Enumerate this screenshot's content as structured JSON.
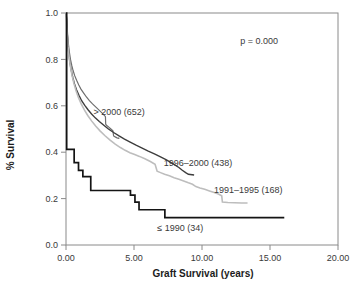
{
  "figure": {
    "background": "#ffffff",
    "frame_color": "#8a8a8a"
  },
  "annotations": {
    "p_value": "p = 0.000"
  },
  "chart_data": {
    "type": "line",
    "title": "",
    "subtitle": "",
    "xlabel": "Graft Survival (years)",
    "ylabel": "% Survival",
    "xlim": [
      0,
      20
    ],
    "ylim": [
      0,
      1.0
    ],
    "xticks": [
      0,
      5,
      10,
      15,
      20
    ],
    "xtick_labels": [
      "0.00",
      "5.00",
      "10.00",
      "15.00",
      "20.00"
    ],
    "yticks": [
      0.0,
      0.2,
      0.4,
      0.6,
      0.8,
      1.0
    ],
    "ytick_labels": [
      "0.0",
      "0.2",
      "0.4",
      "0.6",
      "0.8",
      "1.0"
    ],
    "grid": false,
    "legend_position": "inline-annotations",
    "annotations": [
      {
        "text": "p = 0.000",
        "x": 14.2,
        "y": 0.865
      }
    ],
    "series": [
      {
        "name": "> 2000 (652)",
        "label": "> 2000 (652)",
        "n": 652,
        "color": "#6e6e6e",
        "linewidth": 1.2,
        "label_x": 3.9,
        "label_y": 0.575,
        "points": [
          [
            0.0,
            1.0
          ],
          [
            0.04,
            0.985
          ],
          [
            0.08,
            0.945
          ],
          [
            0.12,
            0.905
          ],
          [
            0.18,
            0.865
          ],
          [
            0.25,
            0.83
          ],
          [
            0.33,
            0.8
          ],
          [
            0.42,
            0.775
          ],
          [
            0.52,
            0.752
          ],
          [
            0.64,
            0.73
          ],
          [
            0.78,
            0.71
          ],
          [
            0.94,
            0.69
          ],
          [
            1.1,
            0.672
          ],
          [
            1.3,
            0.655
          ],
          [
            1.5,
            0.638
          ],
          [
            1.72,
            0.622
          ],
          [
            1.95,
            0.608
          ],
          [
            2.2,
            0.594
          ],
          [
            2.45,
            0.58
          ],
          [
            2.7,
            0.566
          ],
          [
            2.9,
            0.553
          ],
          [
            2.92,
            0.52
          ],
          [
            3.0,
            0.515
          ],
          [
            3.15,
            0.508
          ],
          [
            3.3,
            0.5
          ],
          [
            3.45,
            0.492
          ],
          [
            3.5,
            0.47
          ],
          [
            3.62,
            0.466
          ],
          [
            3.75,
            0.462
          ],
          [
            3.88,
            0.46
          ],
          [
            3.92,
            0.462
          ]
        ]
      },
      {
        "name": "1996–2000 (438)",
        "label": "1996–2000 (438)",
        "n": 438,
        "color": "#3d3d3d",
        "linewidth": 1.4,
        "label_x": 9.7,
        "label_y": 0.352,
        "points": [
          [
            0.0,
            1.0
          ],
          [
            0.04,
            0.975
          ],
          [
            0.08,
            0.925
          ],
          [
            0.13,
            0.875
          ],
          [
            0.2,
            0.83
          ],
          [
            0.28,
            0.79
          ],
          [
            0.38,
            0.755
          ],
          [
            0.5,
            0.722
          ],
          [
            0.62,
            0.695
          ],
          [
            0.78,
            0.668
          ],
          [
            0.95,
            0.645
          ],
          [
            1.15,
            0.622
          ],
          [
            1.38,
            0.602
          ],
          [
            1.62,
            0.583
          ],
          [
            1.88,
            0.565
          ],
          [
            2.15,
            0.548
          ],
          [
            2.45,
            0.532
          ],
          [
            2.78,
            0.516
          ],
          [
            3.12,
            0.5
          ],
          [
            3.5,
            0.485
          ],
          [
            3.9,
            0.47
          ],
          [
            4.3,
            0.456
          ],
          [
            4.72,
            0.443
          ],
          [
            5.15,
            0.43
          ],
          [
            5.6,
            0.418
          ],
          [
            6.05,
            0.405
          ],
          [
            6.5,
            0.393
          ],
          [
            6.95,
            0.38
          ],
          [
            7.35,
            0.368
          ],
          [
            7.7,
            0.356
          ],
          [
            8.0,
            0.345
          ],
          [
            8.3,
            0.334
          ],
          [
            8.55,
            0.322
          ],
          [
            8.8,
            0.312
          ],
          [
            9.0,
            0.305
          ],
          [
            9.42,
            0.302
          ]
        ]
      },
      {
        "name": "1991–1995 (168)",
        "label": "1991–1995 (168)",
        "n": 168,
        "color": "#bdbdbd",
        "linewidth": 1.6,
        "label_x": 13.4,
        "label_y": 0.238,
        "points": [
          [
            0.0,
            1.0
          ],
          [
            0.04,
            0.96
          ],
          [
            0.09,
            0.905
          ],
          [
            0.15,
            0.855
          ],
          [
            0.23,
            0.81
          ],
          [
            0.33,
            0.768
          ],
          [
            0.45,
            0.73
          ],
          [
            0.58,
            0.697
          ],
          [
            0.74,
            0.665
          ],
          [
            0.92,
            0.635
          ],
          [
            1.12,
            0.608
          ],
          [
            1.35,
            0.582
          ],
          [
            1.6,
            0.558
          ],
          [
            1.88,
            0.535
          ],
          [
            2.18,
            0.513
          ],
          [
            2.5,
            0.492
          ],
          [
            2.85,
            0.472
          ],
          [
            3.22,
            0.453
          ],
          [
            3.62,
            0.435
          ],
          [
            4.0,
            0.42
          ],
          [
            4.35,
            0.408
          ],
          [
            4.7,
            0.398
          ],
          [
            5.05,
            0.39
          ],
          [
            5.4,
            0.382
          ],
          [
            5.8,
            0.372
          ],
          [
            6.2,
            0.36
          ],
          [
            6.55,
            0.348
          ],
          [
            6.7,
            0.318
          ],
          [
            6.95,
            0.312
          ],
          [
            7.25,
            0.305
          ],
          [
            7.6,
            0.298
          ],
          [
            7.95,
            0.29
          ],
          [
            8.3,
            0.283
          ],
          [
            8.65,
            0.276
          ],
          [
            9.0,
            0.268
          ],
          [
            9.3,
            0.262
          ],
          [
            9.55,
            0.252
          ],
          [
            9.85,
            0.246
          ],
          [
            10.2,
            0.24
          ],
          [
            10.55,
            0.233
          ],
          [
            10.9,
            0.226
          ],
          [
            11.2,
            0.22
          ],
          [
            11.45,
            0.212
          ],
          [
            11.5,
            0.185
          ],
          [
            11.9,
            0.183
          ],
          [
            12.4,
            0.182
          ],
          [
            12.9,
            0.181
          ],
          [
            13.35,
            0.181
          ]
        ]
      },
      {
        "name": "≤ 1990 (34)",
        "label": "≤ 1990 (34)",
        "n": 34,
        "color": "#141414",
        "linewidth": 1.7,
        "label_x": 8.4,
        "label_y": 0.072,
        "step": true,
        "points": [
          [
            0.0,
            1.0
          ],
          [
            0.05,
            0.412
          ],
          [
            0.58,
            0.412
          ],
          [
            0.6,
            0.355
          ],
          [
            0.9,
            0.355
          ],
          [
            0.92,
            0.322
          ],
          [
            1.22,
            0.322
          ],
          [
            1.24,
            0.295
          ],
          [
            1.8,
            0.295
          ],
          [
            1.82,
            0.235
          ],
          [
            4.72,
            0.235
          ],
          [
            4.74,
            0.215
          ],
          [
            5.05,
            0.215
          ],
          [
            5.07,
            0.185
          ],
          [
            5.35,
            0.185
          ],
          [
            5.37,
            0.152
          ],
          [
            7.25,
            0.152
          ],
          [
            7.27,
            0.118
          ],
          [
            16.05,
            0.118
          ]
        ]
      }
    ]
  }
}
